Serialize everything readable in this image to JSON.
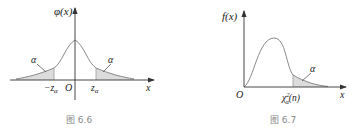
{
  "figures": [
    {
      "id": "fig-6-6",
      "caption": "图 6.6",
      "y_label": "φ(x)",
      "x_label": "x",
      "origin_label": "O",
      "left_quantile_label": "−z",
      "left_quantile_sub": "α",
      "right_quantile_label": "z",
      "right_quantile_sub": "α",
      "left_area_label": "α",
      "right_area_label": "α",
      "curve": "standard normal density",
      "shaded_regions": [
        "x < −z_α",
        "x > z_α"
      ]
    },
    {
      "id": "fig-6-7",
      "caption": "图 6.7",
      "y_label": "f(x)",
      "x_label": "x",
      "origin_label": "O",
      "quantile_label": "χ",
      "quantile_sup": "2",
      "quantile_sub": "α",
      "quantile_arg": "(n)",
      "area_label": "α",
      "curve": "chi-square density with n degrees of freedom",
      "shaded_regions": [
        "x > χ²_α(n)"
      ]
    }
  ],
  "colors": {
    "curve": "#8a8a8a",
    "axis": "#333333",
    "shade": "#d9d9d9",
    "caption": "#888888"
  }
}
